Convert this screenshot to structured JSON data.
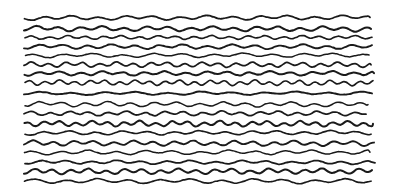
{
  "artwork": {
    "title": "Wavy Horizontal Lines Sketch",
    "description": "Hand-drawn pattern of sixteen slightly wavy black horizontal lines on a white background",
    "type": "line-pattern-sketch",
    "canvas": {
      "width": 400,
      "height": 194,
      "background_color": "#ffffff"
    },
    "stroke": {
      "color": "#1a1a1a",
      "width": 1.8,
      "linecap": "round",
      "linejoin": "round"
    },
    "line_count": 16,
    "geometry": {
      "x_start_nominal": 24,
      "x_end_nominal": 374,
      "first_line_y": 18,
      "last_line_y": 181,
      "nominal_spacing": 10.8,
      "wave_amplitude_range": [
        0.8,
        2.2
      ],
      "wave_wavelength_range": [
        14,
        34
      ]
    },
    "lines": [
      {
        "index": 1,
        "y": 18.0,
        "x_start": 24.5,
        "x_end": 370.0,
        "amplitude": 1.5,
        "wavelength": 27.0,
        "phase": 0.0,
        "tilt": -0.6
      },
      {
        "index": 2,
        "y": 28.5,
        "x_start": 24.0,
        "x_end": 371.0,
        "amplitude": 1.7,
        "wavelength": 22.0,
        "phase": 1.2,
        "tilt": 0.4
      },
      {
        "index": 3,
        "y": 37.5,
        "x_start": 25.0,
        "x_end": 372.0,
        "amplitude": 1.3,
        "wavelength": 18.0,
        "phase": 2.4,
        "tilt": -0.2
      },
      {
        "index": 4,
        "y": 46.5,
        "x_start": 24.0,
        "x_end": 372.0,
        "amplitude": 1.6,
        "wavelength": 24.0,
        "phase": 0.7,
        "tilt": 0.3
      },
      {
        "index": 5,
        "y": 55.5,
        "x_start": 25.5,
        "x_end": 369.0,
        "amplitude": 1.4,
        "wavelength": 30.0,
        "phase": 3.1,
        "tilt": -0.5
      },
      {
        "index": 6,
        "y": 64.5,
        "x_start": 24.0,
        "x_end": 371.0,
        "amplitude": 1.8,
        "wavelength": 17.0,
        "phase": 1.9,
        "tilt": 0.2
      },
      {
        "index": 7,
        "y": 73.5,
        "x_start": 24.5,
        "x_end": 374.0,
        "amplitude": 1.5,
        "wavelength": 21.0,
        "phase": 0.4,
        "tilt": -0.3
      },
      {
        "index": 8,
        "y": 82.5,
        "x_start": 25.0,
        "x_end": 373.0,
        "amplitude": 1.9,
        "wavelength": 15.0,
        "phase": 2.7,
        "tilt": 0.5
      },
      {
        "index": 9,
        "y": 93.5,
        "x_start": 24.0,
        "x_end": 372.0,
        "amplitude": 1.1,
        "wavelength": 32.0,
        "phase": 1.5,
        "tilt": -0.4
      },
      {
        "index": 10,
        "y": 104.0,
        "x_start": 25.0,
        "x_end": 368.0,
        "amplitude": 1.7,
        "wavelength": 23.0,
        "phase": 0.9,
        "tilt": 0.6
      },
      {
        "index": 11,
        "y": 113.5,
        "x_start": 24.0,
        "x_end": 366.0,
        "amplitude": 1.6,
        "wavelength": 19.0,
        "phase": 2.2,
        "tilt": -0.2
      },
      {
        "index": 12,
        "y": 123.5,
        "x_start": 24.5,
        "x_end": 373.0,
        "amplitude": 2.0,
        "wavelength": 16.0,
        "phase": 3.4,
        "tilt": 0.3
      },
      {
        "index": 13,
        "y": 133.0,
        "x_start": 25.0,
        "x_end": 371.0,
        "amplitude": 1.4,
        "wavelength": 26.0,
        "phase": 0.2,
        "tilt": -0.5
      },
      {
        "index": 14,
        "y": 143.0,
        "x_start": 24.0,
        "x_end": 374.0,
        "amplitude": 1.8,
        "wavelength": 20.0,
        "phase": 1.7,
        "tilt": 0.4
      },
      {
        "index": 15,
        "y": 152.5,
        "x_start": 24.5,
        "x_end": 370.0,
        "amplitude": 1.5,
        "wavelength": 28.0,
        "phase": 2.9,
        "tilt": -0.3
      },
      {
        "index": 16,
        "y": 162.0,
        "x_start": 25.0,
        "x_end": 375.0,
        "amplitude": 1.3,
        "wavelength": 25.0,
        "phase": 0.6,
        "tilt": 0.5
      },
      {
        "index": 17,
        "y": 171.5,
        "x_start": 24.0,
        "x_end": 372.0,
        "amplitude": 1.9,
        "wavelength": 18.0,
        "phase": 1.1,
        "tilt": -0.4
      },
      {
        "index": 18,
        "y": 181.0,
        "x_start": 24.5,
        "x_end": 371.0,
        "amplitude": 1.6,
        "wavelength": 31.0,
        "phase": 2.5,
        "tilt": 0.2
      }
    ]
  }
}
